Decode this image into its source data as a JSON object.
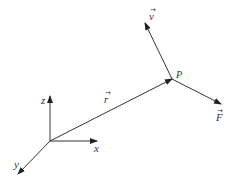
{
  "diagram": {
    "colors": {
      "stroke": "#333333",
      "background": "#ffffff"
    },
    "axes": {
      "z": {
        "label": "z"
      },
      "x": {
        "label": "x"
      },
      "y": {
        "label": "y"
      }
    },
    "vectors": {
      "r": {
        "label": "r",
        "accent": "→"
      },
      "v": {
        "label": "v",
        "accent": "→"
      },
      "F": {
        "label": "F",
        "accent": "→"
      }
    },
    "point": {
      "label": "P"
    }
  }
}
